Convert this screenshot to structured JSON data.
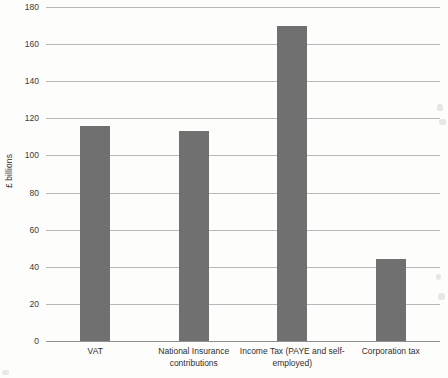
{
  "chart_data": {
    "type": "bar",
    "title": "",
    "subtitle": "",
    "xlabel": "",
    "ylabel": "£ billions",
    "categories": [
      "VAT",
      "National Insurance contributions",
      "Income Tax (PAYE and self-employed)",
      "Corporation tax"
    ],
    "values": [
      116,
      113,
      170,
      44
    ],
    "ylim": [
      0,
      180
    ],
    "yticks": [
      0,
      20,
      40,
      60,
      80,
      100,
      120,
      140,
      160,
      180
    ],
    "ytick_labels": [
      "0",
      "20",
      "40",
      "60",
      "80",
      "100",
      "120",
      "140",
      "160",
      "180"
    ],
    "grid": true,
    "grid_axis": "y",
    "legend": false,
    "legend_position": "none",
    "bar_color": "#707070",
    "gridline_color": "#b9b9b9",
    "axis_color": "#8f8f8f",
    "background_color": "#fdfdfb"
  },
  "axis": {
    "y_title": "£ billions"
  },
  "bars": [
    {
      "label": "VAT",
      "label_lines": [
        "VAT"
      ],
      "value": 116
    },
    {
      "label": "National Insurance contributions",
      "label_lines": [
        "National Insurance",
        "contributions"
      ],
      "value": 113
    },
    {
      "label": "Income Tax (PAYE and self-employed)",
      "label_lines": [
        "Income Tax (PAYE and self-",
        "employed)"
      ],
      "value": 170
    },
    {
      "label": "Corporation tax",
      "label_lines": [
        "Corporation tax"
      ],
      "value": 44
    }
  ]
}
